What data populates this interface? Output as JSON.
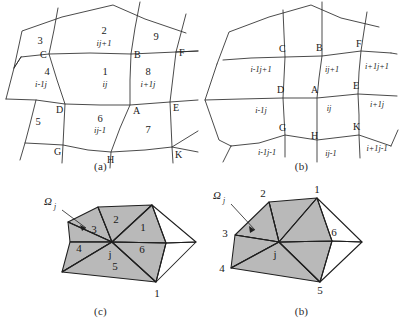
{
  "figure": {
    "panels": [
      {
        "id": "a",
        "caption": "(a)",
        "type": "curvilinear-quad-mesh",
        "description": "Structured curvilinear quadrilateral mesh with lettered nodes and numbered cells",
        "nodes": [
          {
            "label": "C",
            "x": 49,
            "y": 54
          },
          {
            "label": "B",
            "x": 131,
            "y": 54
          },
          {
            "label": "F",
            "x": 176,
            "y": 52
          },
          {
            "label": "D",
            "x": 65,
            "y": 104
          },
          {
            "label": "A",
            "x": 130,
            "y": 105
          },
          {
            "label": "E",
            "x": 170,
            "y": 102
          },
          {
            "label": "G",
            "x": 63,
            "y": 145
          },
          {
            "label": "H",
            "x": 111,
            "y": 152
          },
          {
            "label": "K",
            "x": 172,
            "y": 147
          }
        ],
        "cells": [
          {
            "num": "3",
            "index": "",
            "x": 40,
            "y": 40
          },
          {
            "num": "2",
            "index": "ij+1",
            "x": 104,
            "y": 36
          },
          {
            "num": "9",
            "index": "",
            "x": 156,
            "y": 39
          },
          {
            "num": "4",
            "index": "i-1j",
            "x": 47,
            "y": 75
          },
          {
            "num": "1",
            "index": "ij",
            "x": 105,
            "y": 75
          },
          {
            "num": "8",
            "index": "i+1j",
            "x": 147,
            "y": 75
          },
          {
            "num": "5",
            "index": "",
            "x": 38,
            "y": 122
          },
          {
            "num": "6",
            "index": "ij-1",
            "x": 100,
            "y": 122
          },
          {
            "num": "7",
            "index": "",
            "x": 146,
            "y": 128
          }
        ]
      },
      {
        "id": "b",
        "caption": "(b)",
        "type": "curvilinear-quad-mesh",
        "description": "Same mesh with global index labels placed beneath each lettered node",
        "nodes": [
          {
            "label": "C",
            "index": "i-1j+1",
            "x": 84,
            "y": 57,
            "ix": 66,
            "iy": 72
          },
          {
            "label": "B",
            "index": "ij+1",
            "x": 121,
            "y": 56,
            "ix": 128,
            "iy": 72
          },
          {
            "label": "F",
            "index": "i+1j+1",
            "x": 160,
            "y": 51,
            "ix": 176,
            "iy": 70
          },
          {
            "label": "D",
            "index": "i-1j",
            "x": 82,
            "y": 98,
            "ix": 63,
            "iy": 113
          },
          {
            "label": "A",
            "index": "ij",
            "x": 116,
            "y": 98,
            "ix": 130,
            "iy": 112
          },
          {
            "label": "E",
            "index": "i+1j",
            "x": 157,
            "y": 94,
            "ix": 174,
            "iy": 108
          },
          {
            "label": "G",
            "index": "i-1j-1",
            "x": 84,
            "y": 135,
            "ix": 69,
            "iy": 155
          },
          {
            "label": "H",
            "index": "ij-1",
            "x": 116,
            "y": 140,
            "ix": 130,
            "iy": 155
          },
          {
            "label": "K",
            "index": "i+1j-1",
            "x": 158,
            "y": 135,
            "ix": 175,
            "iy": 152
          }
        ]
      },
      {
        "id": "c",
        "caption": "(c)",
        "type": "triangle-fan-support-domain",
        "description": "Shaded triangular support domain around central node j; triangle numbers inside cells",
        "center_label": "j",
        "omega_label": "Ω",
        "omega_subscript": "j",
        "triangle_numbers": [
          "1",
          "2",
          "3",
          "4",
          "5",
          "6"
        ],
        "vertex_labels": [
          "1"
        ]
      },
      {
        "id": "d",
        "caption": "(b)",
        "type": "triangle-fan-support-domain",
        "description": "Shaded triangular support domain around central node j; vertex numbers placed outside at the ring nodes",
        "center_label": "j",
        "omega_label": "Ω",
        "omega_subscript": "j",
        "vertex_labels": [
          "1",
          "2",
          "3",
          "4",
          "5",
          "6"
        ]
      }
    ]
  },
  "style": {
    "shade_fill": "#b9b9b9",
    "line_color": "#2b2b2b",
    "background": "#ffffff"
  }
}
